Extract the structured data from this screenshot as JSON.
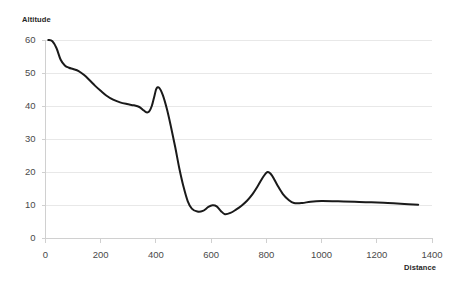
{
  "chart_data": {
    "type": "line",
    "title": "",
    "xlabel": "Distance",
    "ylabel": "Altitude",
    "xlim": [
      0,
      1400
    ],
    "ylim": [
      0,
      60
    ],
    "x_ticks": [
      0,
      200,
      400,
      600,
      800,
      1000,
      1200,
      1400
    ],
    "y_ticks": [
      0,
      10,
      20,
      30,
      40,
      50,
      60
    ],
    "grid": "horizontal",
    "legend": "none",
    "series": [
      {
        "name": "Altitude",
        "color": "#1a1a1a",
        "x": [
          10,
          25,
          40,
          55,
          70,
          85,
          100,
          120,
          140,
          160,
          180,
          200,
          220,
          245,
          270,
          295,
          320,
          340,
          355,
          365,
          375,
          385,
          395,
          402,
          412,
          425,
          440,
          455,
          470,
          485,
          500,
          515,
          530,
          550,
          570,
          590,
          605,
          620,
          635,
          650,
          670,
          690,
          710,
          730,
          750,
          770,
          790,
          805,
          820,
          840,
          860,
          880,
          900,
          930,
          960,
          1000,
          1060,
          1120,
          1180,
          1240,
          1300,
          1350
        ],
        "y": [
          60.0,
          59.6,
          57.5,
          54.0,
          52.3,
          51.6,
          51.2,
          50.6,
          49.4,
          47.8,
          46.1,
          44.6,
          43.2,
          41.9,
          41.1,
          40.6,
          40.2,
          39.7,
          38.7,
          38.1,
          38.3,
          40.0,
          43.2,
          45.3,
          45.5,
          43.3,
          39.0,
          33.5,
          27.5,
          21.0,
          15.5,
          11.2,
          8.9,
          8.0,
          8.2,
          9.4,
          9.9,
          9.6,
          8.2,
          7.2,
          7.6,
          8.6,
          9.8,
          11.3,
          13.3,
          15.9,
          18.7,
          20.0,
          19.0,
          16.0,
          13.3,
          11.6,
          10.6,
          10.6,
          11.0,
          11.2,
          11.1,
          11.0,
          10.8,
          10.6,
          10.3,
          10.1
        ]
      }
    ]
  },
  "axes": {
    "y_title": "Altitude",
    "x_title": "Distance",
    "y_tick_labels": [
      "60",
      "50",
      "40",
      "30",
      "20",
      "10",
      "0"
    ],
    "x_tick_labels": [
      "0",
      "200",
      "400",
      "600",
      "800",
      "1000",
      "1200",
      "1400"
    ]
  },
  "style": {
    "line_color": "#1a1a1a",
    "grid_color": "#e8e8e8",
    "axis_color": "#d0d0d0",
    "text_color": "#4a4a4a",
    "background": "#ffffff"
  }
}
